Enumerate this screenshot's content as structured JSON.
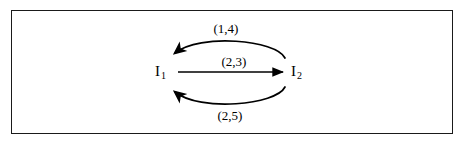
{
  "figure": {
    "background_color": "#ffffff",
    "border_color": "#1a1a1a",
    "line_color": "#000000"
  },
  "diagram": {
    "type": "directed-multigraph",
    "nodes": [
      {
        "id": "I1",
        "base": "I",
        "subscript": "1"
      },
      {
        "id": "I2",
        "base": "I",
        "subscript": "2"
      }
    ],
    "edges": [
      {
        "id": "edge-top",
        "from": "I2",
        "to": "I1",
        "shape": "curve-above",
        "label": "(1,4)",
        "arrowhead_at": "I1"
      },
      {
        "id": "edge-middle",
        "from": "I1",
        "to": "I2",
        "shape": "straight",
        "label": "(2,3)",
        "arrowhead_at": "I2"
      },
      {
        "id": "edge-bottom",
        "from": "I2",
        "to": "I1",
        "shape": "curve-below",
        "label": "(2,5)",
        "arrowhead_at": "I1"
      }
    ]
  }
}
